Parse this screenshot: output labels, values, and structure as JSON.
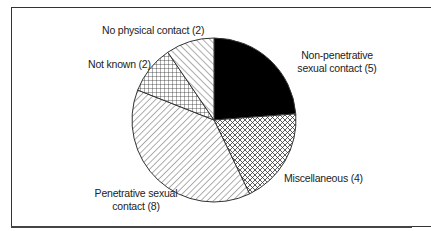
{
  "chart_data": {
    "type": "pie",
    "title": "",
    "total": 21,
    "slices": [
      {
        "label": "Non-penetrative sexual contact",
        "value": 5,
        "pattern": "solid-black"
      },
      {
        "label": "Miscellaneous",
        "value": 4,
        "pattern": "diagonal-crosshatch"
      },
      {
        "label": "Penetrative sexual contact",
        "value": 8,
        "pattern": "back-diagonal-lines"
      },
      {
        "label": "Not known",
        "value": 2,
        "pattern": "square-grid"
      },
      {
        "label": "No physical contact",
        "value": 2,
        "pattern": "forward-diagonal-lines"
      }
    ],
    "start_angle": "12 o'clock",
    "direction": "clockwise",
    "legend": "none (direct labels)"
  },
  "labels": {
    "no_physical": "No physical contact (2)",
    "not_known": "Not known (2)",
    "non_pen_line1": "Non-penetrative",
    "non_pen_line2": "sexual contact (5)",
    "misc": "Miscellaneous (4)",
    "pen_line1": "Penetrative sexual",
    "pen_line2": "contact (8)"
  }
}
